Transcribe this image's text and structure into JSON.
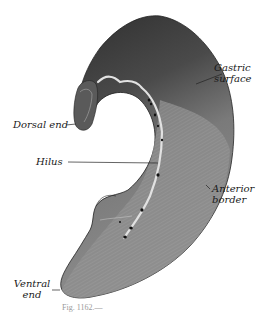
{
  "figure": {
    "caption_fragment": "Fig. 1162.—",
    "colors": {
      "background": "#ffffff",
      "organ_dark": "#3a3a3a",
      "organ_mid": "#6e6e6e",
      "organ_light": "#a8a8a8",
      "hilus_highlight": "#d8d8d8",
      "leader_line": "#222222",
      "label_text": "#1a1a1a"
    }
  },
  "labels": {
    "gastric_surface": {
      "line1": "Gastric",
      "line2": "surface"
    },
    "dorsal_end": {
      "text": "Dorsal end"
    },
    "hilus": {
      "text": "Hilus"
    },
    "anterior_border": {
      "line1": "Anterior",
      "line2": "border"
    },
    "ventral_end": {
      "line1": "Ventral",
      "line2": "end"
    }
  }
}
